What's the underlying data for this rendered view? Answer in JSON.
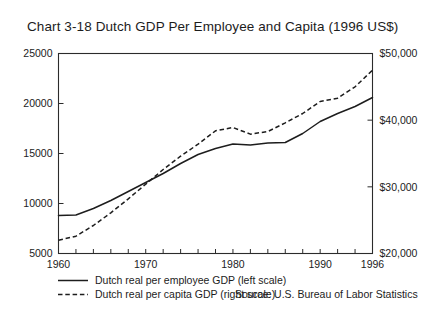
{
  "chart_data": {
    "type": "line",
    "title": "Chart 3-18  Dutch GDP Per Employee and Capita (1996 US$)",
    "xlabel": "",
    "ylabel": "",
    "grid": false,
    "legend_position": "below-left",
    "x": [
      1960,
      1962,
      1964,
      1966,
      1968,
      1970,
      1972,
      1974,
      1976,
      1978,
      1980,
      1982,
      1984,
      1986,
      1988,
      1990,
      1992,
      1994,
      1996
    ],
    "xlim": [
      1960,
      1996
    ],
    "xticks": [
      1960,
      1970,
      1980,
      1990,
      1996
    ],
    "xtick_labels": [
      "1960",
      "1970",
      "1980",
      "1990",
      "1996"
    ],
    "x_minor_tick_interval": 2,
    "left_axis": {
      "ylim": [
        5000,
        25000
      ],
      "yticks": [
        5000,
        10000,
        15000,
        20000,
        25000
      ],
      "ytick_labels": [
        "5000",
        "10000",
        "15000",
        "20000",
        "25000"
      ]
    },
    "right_axis": {
      "ylim": [
        20000,
        50000
      ],
      "yticks": [
        20000,
        30000,
        40000,
        50000
      ],
      "ytick_labels": [
        "$20,000",
        "$30,000",
        "$40,000",
        "$50,000"
      ]
    },
    "series": [
      {
        "name": "Dutch real per employee GDP (left scale)",
        "axis": "left",
        "style": "solid",
        "values": [
          8800,
          8850,
          9500,
          10300,
          11200,
          12100,
          13000,
          14000,
          14900,
          15500,
          15950,
          15850,
          16050,
          16100,
          17000,
          18200,
          19000,
          19700,
          20600
        ]
      },
      {
        "name": "Dutch real per capita GDP (right scale)",
        "axis": "right",
        "style": "dashed",
        "values": [
          22000,
          22600,
          24200,
          26100,
          28200,
          30400,
          32600,
          34600,
          36400,
          38400,
          38900,
          37900,
          38300,
          39600,
          41000,
          42800,
          43300,
          45000,
          47500
        ]
      }
    ]
  },
  "legend": {
    "items": [
      {
        "label": "Dutch real per employee GDP (left scale)",
        "style": "solid"
      },
      {
        "label": "Dutch real per capita GDP (right scale)",
        "style": "dashed"
      }
    ]
  },
  "source": {
    "text": "Source: U.S. Bureau of Labor Statistics"
  }
}
